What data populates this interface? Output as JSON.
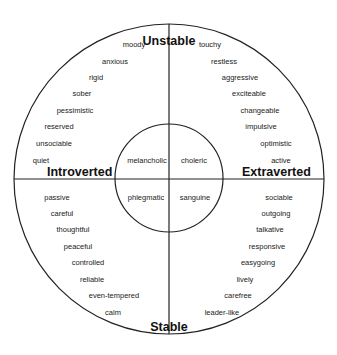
{
  "axes": {
    "top": "Unstable",
    "bottom": "Stable",
    "left": "Introverted",
    "right": "Extraverted"
  },
  "temperaments": {
    "top_left": "melancholic",
    "top_right": "choleric",
    "bottom_left": "phlegmatic",
    "bottom_right": "sanguine"
  },
  "quadrants": {
    "unstable_introverted": [
      "moody",
      "anxious",
      "rigid",
      "sober",
      "pessimistic",
      "reserved",
      "unsociable",
      "quiet"
    ],
    "unstable_extraverted": [
      "touchy",
      "restless",
      "aggressive",
      "exciteable",
      "changeable",
      "impulsive",
      "optimistic",
      "active"
    ],
    "stable_introverted": [
      "passive",
      "careful",
      "thoughtful",
      "peaceful",
      "controlled",
      "reliable",
      "even-tempered",
      "calm"
    ],
    "stable_extraverted": [
      "sociable",
      "outgoing",
      "talkative",
      "responsive",
      "easygoing",
      "lively",
      "carefree",
      "leader-like"
    ]
  },
  "colors": {
    "line": "#222222",
    "text": "#222222",
    "background": "#ffffff"
  }
}
